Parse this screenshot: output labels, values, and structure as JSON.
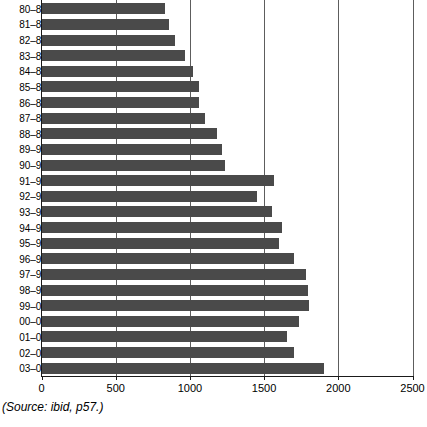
{
  "chart_data": {
    "type": "bar",
    "orientation": "horizontal",
    "title": "",
    "subtitle": "",
    "xlabel": "",
    "ylabel": "",
    "xlim": [
      0,
      2500
    ],
    "ylim": null,
    "grid": true,
    "legend": null,
    "legend_position": "none",
    "bar_color": "#4a4a4a",
    "axis_color": "#1a1a1a",
    "gridline_color": "#5d5d5d",
    "xticks": [
      0,
      500,
      1000,
      1500,
      2000,
      2500
    ],
    "xtick_labels": [
      "0",
      "500",
      "1000",
      "1500",
      "2000",
      "2500"
    ],
    "categories": [
      "80–81",
      "81–82",
      "82–83",
      "83–84",
      "84–85",
      "85–86",
      "86–87",
      "87–88",
      "88–89",
      "89–90",
      "90–91",
      "91–92",
      "92–93",
      "93–94",
      "94–95",
      "95–96",
      "96–97",
      "97–98",
      "98–99",
      "99–00",
      "00–01",
      "01–02",
      "02–03",
      "03–04"
    ],
    "values": [
      830,
      855,
      895,
      965,
      1020,
      1060,
      1060,
      1100,
      1180,
      1210,
      1235,
      1560,
      1450,
      1550,
      1620,
      1595,
      1700,
      1780,
      1790,
      1800,
      1730,
      1650,
      1695,
      1900
    ]
  },
  "source": {
    "text": "(Source: ibid, p57.)"
  }
}
